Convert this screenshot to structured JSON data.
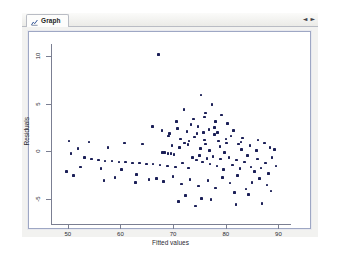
{
  "window": {
    "tab": {
      "label": "Graph",
      "icon": "graph-icon"
    },
    "nav": {
      "prev": "◄",
      "next": "►"
    }
  },
  "chart_data": {
    "type": "scatter",
    "title": "",
    "xlabel": "Fitted values",
    "ylabel": "Residuals",
    "xlim": [
      47,
      92
    ],
    "ylim": [
      -6.2,
      11.2
    ],
    "xticks": [
      50,
      60,
      70,
      80,
      90
    ],
    "yticks": [
      -5,
      0,
      5,
      10
    ],
    "xtick_labels": [
      "50",
      "60",
      "70",
      "80",
      "90"
    ],
    "ytick_labels": [
      "-5",
      "0",
      "5",
      "10"
    ],
    "grid": false,
    "legend": false,
    "marker_color": "#1b1f57",
    "points": [
      [
        67.2,
        10.1
      ],
      [
        75.3,
        5.9
      ],
      [
        72.1,
        4.4
      ],
      [
        77.4,
        4.9
      ],
      [
        76.2,
        4.0
      ],
      [
        79.2,
        3.8
      ],
      [
        70.6,
        3.1
      ],
      [
        66.1,
        2.6
      ],
      [
        73.9,
        3.4
      ],
      [
        78.1,
        3.1
      ],
      [
        80.3,
        2.9
      ],
      [
        74.7,
        2.6
      ],
      [
        76.8,
        2.3
      ],
      [
        72.6,
        2.1
      ],
      [
        69.3,
        1.9
      ],
      [
        75.8,
        2.0
      ],
      [
        77.9,
        1.8
      ],
      [
        81.0,
        1.6
      ],
      [
        83.2,
        1.4
      ],
      [
        71.4,
        1.3
      ],
      [
        74.1,
        1.5
      ],
      [
        76.0,
        1.2
      ],
      [
        78.6,
        1.1
      ],
      [
        80.1,
        0.9
      ],
      [
        82.4,
        0.8
      ],
      [
        84.6,
        0.6
      ],
      [
        86.1,
        1.2
      ],
      [
        87.3,
        0.9
      ],
      [
        88.4,
        0.4
      ],
      [
        89.2,
        0.2
      ],
      [
        50.6,
        -0.2
      ],
      [
        51.9,
        0.3
      ],
      [
        53.2,
        -0.6
      ],
      [
        54.5,
        -0.8
      ],
      [
        55.8,
        -0.9
      ],
      [
        57.1,
        -1.0
      ],
      [
        58.4,
        -1.0
      ],
      [
        59.7,
        -1.1
      ],
      [
        61.0,
        -1.1
      ],
      [
        62.3,
        -1.2
      ],
      [
        63.6,
        -1.2
      ],
      [
        64.9,
        -1.3
      ],
      [
        66.2,
        -1.3
      ],
      [
        52.4,
        -1.6
      ],
      [
        56.3,
        -1.8
      ],
      [
        60.2,
        -1.9
      ],
      [
        63.1,
        -2.4
      ],
      [
        49.8,
        -2.1
      ],
      [
        51.1,
        -2.5
      ],
      [
        68.0,
        -0.1
      ],
      [
        68.4,
        -0.1
      ],
      [
        69.0,
        -0.2
      ],
      [
        69.6,
        -0.2
      ],
      [
        70.2,
        -0.3
      ],
      [
        67.5,
        -1.4
      ],
      [
        68.9,
        -1.5
      ],
      [
        70.4,
        -1.6
      ],
      [
        71.8,
        -1.2
      ],
      [
        72.9,
        -1.7
      ],
      [
        73.7,
        -0.6
      ],
      [
        74.4,
        -0.9
      ],
      [
        75.0,
        -0.4
      ],
      [
        75.6,
        -1.1
      ],
      [
        76.4,
        -0.7
      ],
      [
        77.0,
        -1.3
      ],
      [
        77.6,
        -0.5
      ],
      [
        78.3,
        -1.5
      ],
      [
        79.0,
        -0.8
      ],
      [
        79.6,
        -1.9
      ],
      [
        80.6,
        -0.6
      ],
      [
        81.3,
        -1.4
      ],
      [
        82.0,
        -0.9
      ],
      [
        82.7,
        -1.8
      ],
      [
        83.5,
        -1.1
      ],
      [
        84.1,
        -0.4
      ],
      [
        84.8,
        -1.6
      ],
      [
        85.4,
        -2.1
      ],
      [
        86.0,
        -0.8
      ],
      [
        86.7,
        -1.7
      ],
      [
        87.5,
        -1.2
      ],
      [
        88.1,
        -2.3
      ],
      [
        88.8,
        -0.6
      ],
      [
        89.5,
        -1.5
      ],
      [
        66.8,
        -2.8
      ],
      [
        68.2,
        -3.1
      ],
      [
        70.0,
        -2.6
      ],
      [
        71.6,
        -3.4
      ],
      [
        73.2,
        -2.9
      ],
      [
        74.8,
        -3.6
      ],
      [
        76.6,
        -3.0
      ],
      [
        78.0,
        -3.8
      ],
      [
        79.4,
        -2.7
      ],
      [
        80.8,
        -3.3
      ],
      [
        82.2,
        -2.5
      ],
      [
        83.8,
        -3.9
      ],
      [
        85.0,
        -3.2
      ],
      [
        86.4,
        -2.8
      ],
      [
        87.8,
        -3.5
      ],
      [
        62.8,
        -3.2
      ],
      [
        65.4,
        -2.9
      ],
      [
        59.0,
        -2.7
      ],
      [
        56.9,
        -3.0
      ],
      [
        72.4,
        -4.6
      ],
      [
        75.4,
        -4.9
      ],
      [
        81.6,
        -4.3
      ],
      [
        84.3,
        -4.5
      ],
      [
        88.6,
        -4.1
      ],
      [
        71.0,
        -5.2
      ],
      [
        77.2,
        -5.0
      ],
      [
        86.9,
        -5.4
      ],
      [
        74.2,
        -5.7
      ],
      [
        81.9,
        -5.5
      ],
      [
        69.8,
        0.6
      ],
      [
        71.2,
        0.4
      ],
      [
        72.8,
        0.7
      ],
      [
        75.2,
        0.3
      ],
      [
        78.9,
        0.5
      ],
      [
        64.2,
        0.8
      ],
      [
        60.8,
        0.9
      ],
      [
        57.6,
        0.4
      ],
      [
        54.0,
        1.0
      ],
      [
        50.2,
        1.1
      ],
      [
        85.8,
        0.1
      ],
      [
        83.0,
        0.2
      ],
      [
        79.8,
        -0.1
      ],
      [
        76.9,
        0.1
      ],
      [
        73.4,
        2.8
      ],
      [
        75.9,
        3.6
      ],
      [
        74.5,
        1.9
      ],
      [
        77.8,
        2.5
      ],
      [
        73.0,
        1.1
      ],
      [
        76.1,
        0.8
      ],
      [
        78.4,
        2.0
      ],
      [
        80.0,
        1.3
      ],
      [
        81.5,
        2.2
      ],
      [
        82.9,
        1.0
      ],
      [
        67.9,
        2.2
      ],
      [
        69.1,
        1.6
      ],
      [
        70.8,
        2.4
      ],
      [
        72.2,
        0.9
      ]
    ]
  }
}
